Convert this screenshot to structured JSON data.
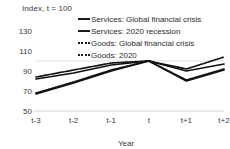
{
  "chart_data": {
    "type": "line",
    "title": "Index, t = 100",
    "xlabel": "Year",
    "ylabel": "",
    "categories": [
      "t-3",
      "t-2",
      "t-1",
      "t",
      "t+1",
      "t+2"
    ],
    "yticks": [
      50,
      70,
      90,
      110,
      130
    ],
    "ylim": [
      50,
      130
    ],
    "grid": "horizontal-at-100",
    "legend_position": "top-right",
    "series": [
      {
        "name": "Services: Global financial crisis",
        "style": "solid",
        "color": "#111111",
        "values": [
          82,
          88,
          96,
          100,
          90,
          97
        ]
      },
      {
        "name": "Services: 2020 recession",
        "style": "solid",
        "color": "#111111",
        "values": [
          67,
          78,
          90,
          100,
          80,
          91
        ]
      },
      {
        "name": "Goods: Global financial crisis",
        "style": "dotted",
        "color": "#111111",
        "values": [
          84,
          91,
          98,
          100,
          92,
          104
        ]
      },
      {
        "name": "Goods: 2020",
        "style": "dotted",
        "color": "#111111",
        "values": [
          68,
          79,
          91,
          100,
          81,
          92
        ]
      }
    ]
  },
  "legend": {
    "items": [
      {
        "label": "Services: Global financial crisis",
        "style": "solid"
      },
      {
        "label": "Services: 2020 recession",
        "style": "solid"
      },
      {
        "label": "Goods: Global financial crisis",
        "style": "dotted"
      },
      {
        "label": "Goods: 2020",
        "style": "dotted"
      }
    ]
  },
  "axis": {
    "title": "Index, t = 100",
    "xlabel": "Year",
    "yticks": [
      "130",
      "110",
      "90",
      "70",
      "50"
    ],
    "xticks": [
      "t-3",
      "t-2",
      "t-1",
      "t",
      "t+1",
      "t+2"
    ]
  }
}
